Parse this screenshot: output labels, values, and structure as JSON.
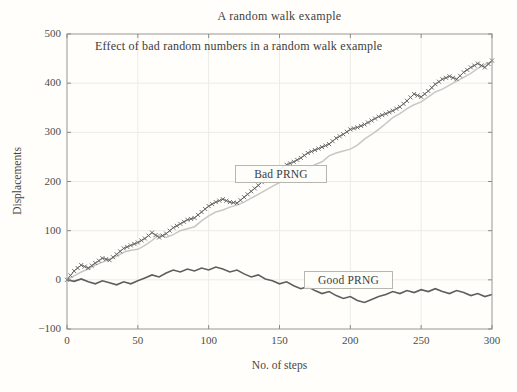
{
  "chart_data": {
    "type": "line",
    "title": "A random walk example",
    "inner_annotation": "Effect of  bad random numbers in a random walk example",
    "xlabel": "No. of steps",
    "ylabel": "Displacements",
    "xlim": [
      0,
      300
    ],
    "ylim": [
      -100,
      500
    ],
    "xticks": [
      0,
      50,
      100,
      150,
      200,
      250,
      300
    ],
    "yticks": [
      -100,
      0,
      100,
      200,
      300,
      400,
      500
    ],
    "grid": true,
    "legend_style": "inline text boxes on plot",
    "x": [
      0,
      5,
      10,
      15,
      20,
      25,
      30,
      35,
      40,
      45,
      50,
      55,
      60,
      65,
      70,
      75,
      80,
      85,
      90,
      95,
      100,
      105,
      110,
      115,
      120,
      125,
      130,
      135,
      140,
      145,
      150,
      155,
      160,
      165,
      170,
      175,
      180,
      185,
      190,
      195,
      200,
      205,
      210,
      215,
      220,
      225,
      230,
      235,
      240,
      245,
      250,
      255,
      260,
      265,
      270,
      275,
      280,
      285,
      290,
      295,
      300
    ],
    "series": [
      {
        "name": "Bad PRNG",
        "label_box": "Bad PRNG",
        "color": "#787878",
        "marker": "x",
        "width": 1,
        "values": [
          0,
          18,
          30,
          24,
          34,
          44,
          40,
          52,
          64,
          70,
          76,
          84,
          96,
          86,
          94,
          106,
          114,
          122,
          126,
          138,
          150,
          158,
          164,
          158,
          156,
          168,
          180,
          192,
          205,
          212,
          224,
          234,
          240,
          248,
          258,
          264,
          270,
          276,
          288,
          296,
          306,
          310,
          316,
          324,
          332,
          338,
          344,
          352,
          364,
          378,
          372,
          384,
          398,
          408,
          414,
          408,
          422,
          432,
          440,
          432,
          446
        ]
      },
      {
        "name": "Bad PRNG (light trace)",
        "label_box": "",
        "color": "#c9c7c3",
        "marker": "none",
        "width": 1.5,
        "values": [
          0,
          8,
          16,
          22,
          30,
          36,
          42,
          48,
          56,
          60,
          62,
          70,
          80,
          92,
          86,
          92,
          100,
          104,
          108,
          120,
          130,
          138,
          142,
          148,
          152,
          158,
          166,
          174,
          182,
          190,
          198,
          206,
          212,
          220,
          226,
          234,
          240,
          252,
          258,
          262,
          266,
          274,
          286,
          296,
          306,
          318,
          330,
          338,
          348,
          356,
          362,
          372,
          382,
          388,
          396,
          404,
          412,
          420,
          430,
          438,
          444
        ]
      },
      {
        "name": "Good PRNG",
        "label_box": "Good PRNG",
        "color": "#5e5e5e",
        "marker": "none",
        "width": 1.6,
        "values": [
          0,
          -3,
          2,
          -4,
          -8,
          -2,
          -6,
          -10,
          -4,
          -8,
          -2,
          4,
          10,
          6,
          14,
          20,
          16,
          22,
          18,
          24,
          20,
          26,
          22,
          16,
          20,
          12,
          6,
          10,
          2,
          -2,
          -8,
          -4,
          -12,
          -18,
          -14,
          -22,
          -28,
          -24,
          -32,
          -38,
          -34,
          -42,
          -46,
          -40,
          -34,
          -30,
          -24,
          -28,
          -22,
          -26,
          -20,
          -24,
          -18,
          -24,
          -28,
          -22,
          -26,
          -32,
          -28,
          -34,
          -30
        ]
      }
    ],
    "colors": {
      "frame": "#999691",
      "grid": "#edebe4",
      "tick": "#8b8b88",
      "text": "#3f3f3f"
    }
  }
}
